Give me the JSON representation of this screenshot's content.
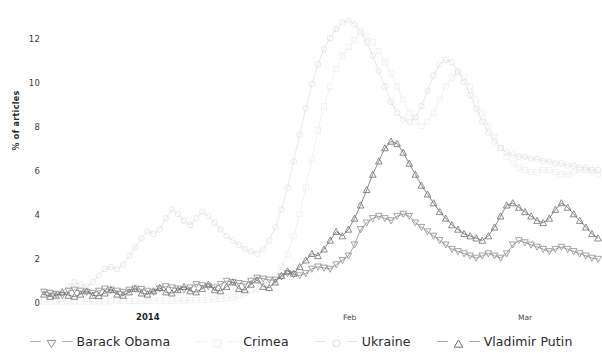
{
  "chart_data": {
    "type": "line",
    "title": "",
    "xlabel": "",
    "ylabel": "% of articles",
    "ylim": [
      0,
      13.2
    ],
    "yticks": [
      0,
      2,
      4,
      6,
      8,
      10,
      12
    ],
    "ytick_labels": [
      "0",
      "2",
      "4",
      "6",
      "8",
      "10",
      "12"
    ],
    "grid": false,
    "legend_position": "bottom",
    "xtick_labels": [
      "2014",
      "Feb",
      "Mar"
    ],
    "xtick_positions": [
      9,
      31,
      59
    ],
    "x_range": [
      0,
      75
    ],
    "x_note": "daily index from 1 Jan 2014; tick 2014 at Jan, Feb at day 31, Mar at day 59",
    "series": [
      {
        "name": "Barack Obama",
        "marker": "triangle-down",
        "color": "#8d8d8d",
        "values": [
          0.45,
          0.4,
          0.35,
          0.3,
          0.5,
          0.55,
          0.5,
          0.45,
          0.4,
          0.5,
          0.6,
          0.55,
          0.5,
          0.45,
          0.55,
          0.6,
          0.58,
          0.5,
          0.45,
          0.6,
          0.7,
          0.65,
          0.6,
          0.55,
          0.65,
          0.8,
          0.75,
          0.7,
          0.65,
          0.8,
          0.95,
          0.9,
          0.85,
          0.8,
          0.95,
          1.1,
          1.05,
          1.0,
          1.0,
          1.15,
          1.3,
          1.25,
          1.2,
          1.3,
          1.5,
          1.6,
          1.55,
          1.5,
          1.7,
          1.9,
          2.1,
          2.6,
          3.3,
          3.6,
          3.8,
          3.9,
          3.8,
          3.7,
          3.9,
          4.0,
          3.9,
          3.6,
          3.4,
          3.2,
          3.0,
          2.8,
          2.6,
          2.4,
          2.3,
          2.2,
          2.1,
          2.0,
          2.1,
          2.2,
          2.1,
          2.0,
          2.2,
          2.6,
          2.8,
          2.7,
          2.6,
          2.5,
          2.4,
          2.3,
          2.4,
          2.5,
          2.4,
          2.3,
          2.2,
          2.1,
          2.0,
          1.95
        ]
      },
      {
        "name": "Crimea",
        "marker": "square",
        "color": "#efefef",
        "values": [
          0.02,
          0.02,
          0.02,
          0.02,
          0.03,
          0.03,
          0.02,
          0.02,
          0.03,
          0.03,
          0.03,
          0.03,
          0.04,
          0.04,
          0.04,
          0.05,
          0.05,
          0.05,
          0.05,
          0.06,
          0.06,
          0.06,
          0.07,
          0.07,
          0.08,
          0.08,
          0.09,
          0.1,
          0.12,
          0.15,
          0.18,
          0.22,
          0.3,
          0.4,
          0.5,
          0.6,
          0.7,
          0.9,
          1.2,
          1.6,
          2.2,
          3.0,
          4.0,
          5.2,
          6.5,
          7.8,
          8.9,
          9.8,
          10.6,
          11.2,
          11.6,
          11.9,
          12.2,
          12.1,
          11.8,
          11.4,
          10.9,
          10.4,
          9.8,
          9.2,
          8.6,
          8.2,
          8.0,
          8.2,
          8.6,
          9.2,
          9.8,
          10.2,
          10.4,
          10.2,
          9.8,
          9.2,
          8.6,
          8.0,
          7.5,
          7.0,
          6.6,
          6.3,
          6.1,
          6.0,
          5.9,
          5.9,
          6.0,
          6.0,
          5.9,
          5.8,
          5.8,
          5.9,
          6.0,
          6.0,
          5.9,
          5.8
        ]
      },
      {
        "name": "Ukraine",
        "marker": "circle",
        "color": "#e2e2e2",
        "values": [
          0.5,
          0.45,
          0.4,
          0.5,
          0.7,
          0.9,
          0.8,
          0.7,
          0.9,
          1.2,
          1.5,
          1.6,
          1.5,
          1.7,
          2.1,
          2.5,
          2.9,
          3.2,
          3.1,
          3.3,
          3.8,
          4.2,
          4.0,
          3.7,
          3.5,
          3.8,
          4.1,
          3.9,
          3.6,
          3.3,
          3.0,
          2.8,
          2.6,
          2.4,
          2.3,
          2.2,
          2.4,
          2.8,
          3.4,
          4.2,
          5.2,
          6.4,
          7.6,
          8.8,
          9.9,
          10.8,
          11.5,
          12.0,
          12.4,
          12.7,
          12.8,
          12.6,
          12.3,
          11.8,
          11.2,
          10.5,
          9.8,
          9.1,
          8.6,
          8.3,
          8.2,
          8.4,
          8.9,
          9.6,
          10.3,
          10.8,
          11.0,
          10.9,
          10.5,
          10.0,
          9.4,
          8.8,
          8.2,
          7.7,
          7.3,
          7.0,
          6.8,
          6.7,
          6.6,
          6.6,
          6.5,
          6.5,
          6.4,
          6.4,
          6.3,
          6.3,
          6.2,
          6.2,
          6.1,
          6.1,
          6.0,
          6.0
        ]
      },
      {
        "name": "Vladimir Putin",
        "marker": "triangle-up",
        "color": "#6e6e6e",
        "values": [
          0.35,
          0.25,
          0.3,
          0.45,
          0.3,
          0.25,
          0.35,
          0.5,
          0.3,
          0.28,
          0.4,
          0.55,
          0.35,
          0.3,
          0.45,
          0.6,
          0.4,
          0.35,
          0.5,
          0.65,
          0.45,
          0.4,
          0.55,
          0.7,
          0.5,
          0.45,
          0.6,
          0.8,
          0.55,
          0.5,
          0.7,
          0.9,
          0.6,
          0.55,
          0.8,
          1.0,
          0.7,
          0.65,
          0.9,
          1.2,
          1.4,
          1.3,
          1.6,
          1.9,
          2.2,
          2.1,
          2.4,
          2.8,
          3.2,
          3.0,
          3.3,
          3.8,
          4.4,
          5.1,
          5.8,
          6.4,
          7.0,
          7.3,
          7.2,
          6.8,
          6.3,
          5.8,
          5.3,
          4.9,
          4.5,
          4.1,
          3.8,
          3.5,
          3.3,
          3.1,
          3.0,
          2.9,
          2.8,
          3.0,
          3.4,
          3.9,
          4.4,
          4.5,
          4.3,
          4.1,
          3.9,
          3.7,
          3.6,
          3.8,
          4.2,
          4.5,
          4.3,
          4.0,
          3.7,
          3.4,
          3.1,
          2.9
        ]
      }
    ]
  },
  "axis": {
    "y_title": "% of articles",
    "ytick_0": "0",
    "ytick_2": "2",
    "ytick_4": "4",
    "ytick_6": "6",
    "ytick_8": "8",
    "ytick_10": "10",
    "ytick_12": "12",
    "xtick_jan": "2014",
    "xtick_feb": "Feb",
    "xtick_mar": "Mar"
  },
  "legend": {
    "items": [
      {
        "label": "Barack Obama",
        "marker": "triangle-down-marker",
        "color": "#9a9a9a"
      },
      {
        "label": "Crimea",
        "marker": "square-marker",
        "color": "#f0f0f0"
      },
      {
        "label": "Ukraine",
        "marker": "circle-marker",
        "color": "#dcdcdc"
      },
      {
        "label": "Vladimir Putin",
        "marker": "triangle-up-marker",
        "color": "#7a7a7a"
      }
    ]
  }
}
